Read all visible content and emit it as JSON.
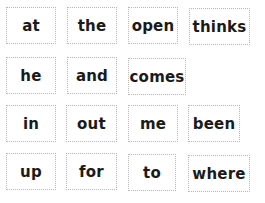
{
  "rows": [
    [
      "at",
      "the",
      "open",
      "thinks"
    ],
    [
      "he",
      "and",
      "comes"
    ],
    [
      "in",
      "out",
      "me",
      "been"
    ],
    [
      "up",
      "for",
      "to",
      "where"
    ]
  ]
}
